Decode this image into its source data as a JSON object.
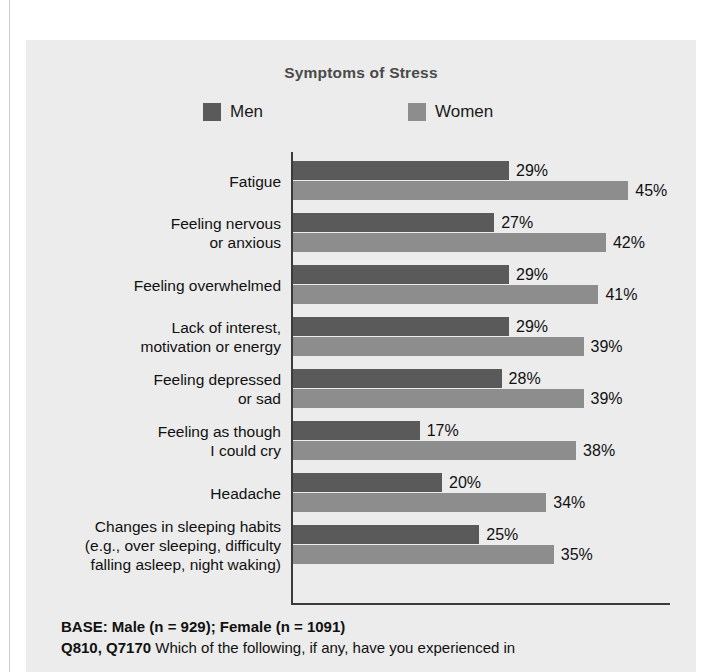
{
  "chart_data": {
    "type": "bar",
    "orientation": "horizontal",
    "title": "Symptoms of Stress",
    "xlabel": "",
    "ylabel": "",
    "grid": false,
    "legend_position": "top",
    "xlim": [
      0,
      50
    ],
    "categories": [
      "Fatigue",
      "Feeling nervous\nor anxious",
      "Feeling overwhelmed",
      "Lack of interest,\nmotivation or energy",
      "Feeling depressed\nor sad",
      "Feeling as though\nI could cry",
      "Headache",
      "Changes in sleeping habits\n(e.g., over sleeping, difficulty\nfalling asleep, night waking)"
    ],
    "series": [
      {
        "name": "Men",
        "color": "#5a5a5a",
        "values": [
          29,
          27,
          29,
          29,
          28,
          17,
          20,
          25
        ],
        "labels": [
          "29%",
          "27%",
          "29%",
          "29%",
          "28%",
          "17%",
          "20%",
          "25%"
        ]
      },
      {
        "name": "Women",
        "color": "#8d8d8d",
        "values": [
          45,
          42,
          41,
          39,
          39,
          38,
          34,
          35
        ],
        "labels": [
          "45%",
          "42%",
          "41%",
          "39%",
          "39%",
          "38%",
          "34%",
          "35%"
        ]
      }
    ]
  },
  "legend": {
    "items": [
      {
        "label": "Men",
        "color": "#5a5a5a"
      },
      {
        "label": "Women",
        "color": "#8d8d8d"
      }
    ]
  },
  "footnotes": {
    "base": "BASE: Male (n = 929); Female (n = 1091)",
    "question_code": "Q810, Q7170",
    "question_text": "Which of the following, if any, have you experienced in"
  },
  "theme": {
    "panel_background": "#ececec",
    "axis_color": "#3b3b3b",
    "title_color": "#4a4a4a",
    "text_color": "#111111"
  }
}
